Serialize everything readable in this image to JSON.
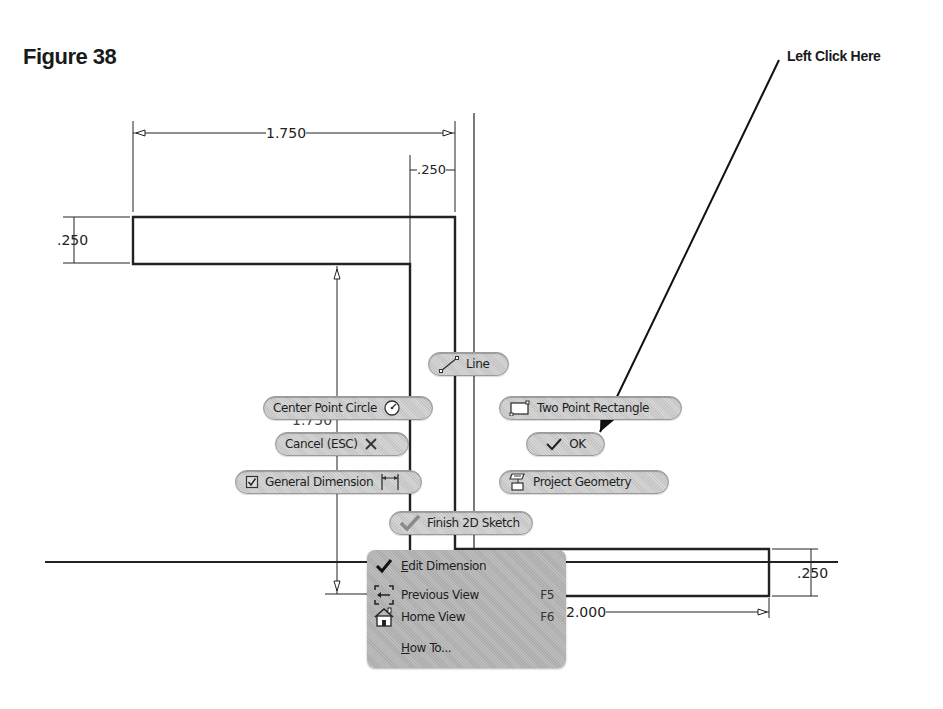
{
  "figure": {
    "title": "Figure 38",
    "callout_text": "Left Click Here"
  },
  "dimensions": {
    "top_width": "1.750",
    "top_thickness": ".250",
    "left_height": ".250",
    "vertical_height": "1.750",
    "bottom_width": "2.000",
    "right_height": ".250"
  },
  "marking_menu": {
    "line": {
      "label": "Line",
      "icon": "line-icon"
    },
    "center_point_circle": {
      "label": "Center Point Circle",
      "icon": "circle-icon"
    },
    "two_point_rectangle": {
      "label": "Two Point Rectangle",
      "icon": "rectangle-icon"
    },
    "cancel": {
      "label": "Cancel (ESC)",
      "icon": "x-icon"
    },
    "ok": {
      "label": "OK",
      "icon": "check-icon"
    },
    "general_dimension": {
      "label": "General Dimension",
      "icon": "dimension-icon"
    },
    "project_geometry": {
      "label": "Project Geometry",
      "icon": "project-geometry-icon"
    },
    "finish_sketch": {
      "label": "Finish 2D Sketch",
      "icon": "check-icon"
    }
  },
  "context_menu": {
    "items": [
      {
        "prefix": "",
        "ul": "E",
        "rest": "dit Dimension",
        "shortcut": "",
        "icon": "check-icon"
      },
      {
        "prefix": "",
        "ul": "",
        "rest": "Previous View",
        "shortcut": "F5",
        "icon": "previous-view-icon"
      },
      {
        "prefix": "",
        "ul": "",
        "rest": "Home View",
        "shortcut": "F6",
        "icon": "home-icon"
      },
      {
        "prefix": "",
        "ul": "H",
        "rest": "ow To...",
        "shortcut": "",
        "icon": ""
      }
    ]
  }
}
